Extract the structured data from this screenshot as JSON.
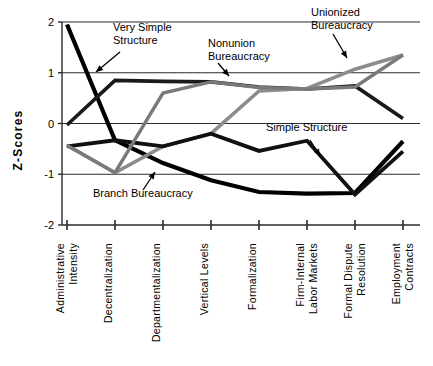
{
  "chart_data": {
    "type": "line",
    "title": "",
    "xlabel": "",
    "ylabel": "Z-Scores",
    "ylim": [
      -2,
      2
    ],
    "yticks": [
      2,
      1,
      0,
      -1,
      -2
    ],
    "ytick_labels": [
      "2",
      "1",
      "0",
      "-1",
      "-2"
    ],
    "grid": true,
    "legend_position": "annotations-inline",
    "categories": [
      "Administrative Intensity",
      "Decentralization",
      "Departmentalization",
      "Vertical Levels",
      "Formalization",
      "Firm-Internal Labor Markets",
      "Formal Dispute Resolution",
      "Employment Contracts"
    ],
    "category_lines": [
      [
        "Administrative",
        "Intensity"
      ],
      [
        "Decentralization"
      ],
      [
        "Departmentalization"
      ],
      [
        "Vertical  Levels"
      ],
      [
        "Formalization"
      ],
      [
        "Firm-Internal",
        "Labor  Markets"
      ],
      [
        "Formal  Dispute",
        "Resolution"
      ],
      [
        "Employment",
        "Contracts"
      ]
    ],
    "series": [
      {
        "name": "Very Simple Structure",
        "color": "#000000",
        "width": 4.2,
        "values": [
          1.95,
          -0.33,
          -0.78,
          -1.12,
          -1.35,
          -1.38,
          -1.37,
          -0.35
        ]
      },
      {
        "name": "Nonunion Bureaucracy",
        "color": "#1a1a1a",
        "width": 3.6,
        "values": [
          -0.03,
          0.85,
          0.83,
          0.82,
          0.72,
          0.68,
          0.74,
          0.1
        ]
      },
      {
        "name": "Unionized Bureaucracy",
        "color": "#8c8c8c",
        "width": 3.6,
        "values": [
          -0.43,
          -0.97,
          -0.45,
          -0.2,
          0.64,
          0.69,
          1.07,
          1.35
        ]
      },
      {
        "name": "Simple Structure",
        "color": "#111111",
        "width": 3.8,
        "values": [
          -0.45,
          -0.33,
          -0.45,
          -0.2,
          -0.54,
          -0.34,
          -1.4,
          -0.55
        ]
      },
      {
        "name": "Branch Bureaucracy",
        "color": "#7a7a7a",
        "width": 3.4,
        "values": [
          -0.43,
          -0.97,
          0.6,
          0.82,
          0.71,
          0.68,
          0.72,
          1.35
        ]
      }
    ],
    "annotations": [
      {
        "label": "Very Simple Structure",
        "lines": [
          "Very Simple",
          "Structure"
        ]
      },
      {
        "label": "Nonunion Bureaucracy",
        "lines": [
          "Nonunion",
          "Bureaucracy"
        ]
      },
      {
        "label": "Unionized Bureaucracy",
        "lines": [
          "Unionized",
          "Bureaucracy"
        ]
      },
      {
        "label": "Simple Structure",
        "lines": [
          "Simple Structure"
        ]
      },
      {
        "label": "Branch Bureaucracy",
        "lines": [
          "Branch Bureaucracy"
        ]
      }
    ]
  }
}
